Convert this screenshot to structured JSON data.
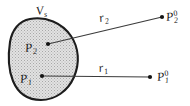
{
  "figure": {
    "type": "diagram",
    "width": 190,
    "height": 106,
    "background_color": "#ffffff",
    "region": {
      "name": "source-volume",
      "label_base": "V",
      "label_sub": "s",
      "outline_color": "#1a1a1a",
      "fill_color": "#d9d9d9",
      "fill_pattern": "stipple"
    },
    "interior_points": [
      {
        "id": "P2",
        "base": "P",
        "sub": "2",
        "sup": "",
        "x": 48,
        "y": 44
      },
      {
        "id": "P1",
        "base": "P",
        "sub": "1",
        "sup": "",
        "x": 42,
        "y": 76
      }
    ],
    "exterior_points": [
      {
        "id": "P20",
        "base": "P",
        "sub": "2",
        "sup": "0",
        "x": 162,
        "y": 17
      },
      {
        "id": "P10",
        "base": "P",
        "sub": "1",
        "sup": "0",
        "x": 150,
        "y": 77
      }
    ],
    "vectors": [
      {
        "id": "r2",
        "base": "r",
        "sub": "2",
        "from": "P2",
        "to": "P20",
        "color": "#3a3a3a"
      },
      {
        "id": "r1",
        "base": "r",
        "sub": "1",
        "from": "P1",
        "to": "P10",
        "color": "#3a3a3a"
      }
    ]
  }
}
